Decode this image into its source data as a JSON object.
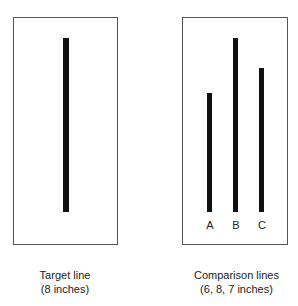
{
  "panels": [
    {
      "name": "target",
      "caption_line1": "Target line",
      "caption_line2": "(8 inches)",
      "lines": [
        {
          "label": "",
          "length_in": 8
        }
      ]
    },
    {
      "name": "comparison",
      "caption_line1": "Comparison lines",
      "caption_line2": "(6, 8, 7 inches)",
      "lines": [
        {
          "label": "A",
          "length_in": 6
        },
        {
          "label": "B",
          "length_in": 8
        },
        {
          "label": "C",
          "length_in": 7
        }
      ]
    }
  ]
}
